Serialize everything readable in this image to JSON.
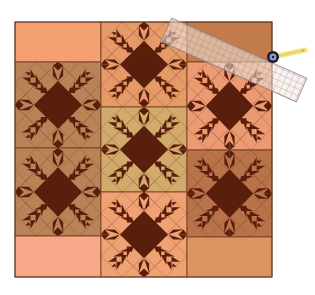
{
  "image": {
    "subject": "quilt layout with feathered star blocks and ruler with rotary cutter",
    "width": 315,
    "height": 295
  },
  "colors": {
    "background": "#ffffff",
    "dark_brown": "#5a1e0c",
    "seam_line": "#6b3b20",
    "left_top_rect": "#f4a070",
    "left_bottom_rect": "#f7a888",
    "left_block_bg": "#b98358",
    "middle_top_block_bg": "#e59a68",
    "middle_mid_block_bg": "#d2aa6c",
    "middle_bottom_block_bg": "#f0a274",
    "right_top_rect": "#c27b4a",
    "right_upper_block_bg": "#eb9a72",
    "right_lower_block_bg": "#b8734a",
    "right_bottom_rect": "#dd9460",
    "ruler_fill": "#f6e8e0",
    "ruler_grid": "#8a7a80",
    "cutter_handle": "#f3e27a",
    "cutter_blade": "#1a1a2a"
  },
  "quilt": {
    "left": 15,
    "top": 22,
    "right": 272,
    "bottom": 277,
    "columns": [
      {
        "name": "left",
        "x": 15,
        "w": 86,
        "pieces": [
          {
            "type": "rect",
            "y": 22,
            "h": 40,
            "color_key": "left_top_rect"
          },
          {
            "type": "block",
            "y": 62,
            "h": 86,
            "color_key": "left_block_bg"
          },
          {
            "type": "block",
            "y": 148,
            "h": 88,
            "color_key": "left_block_bg"
          },
          {
            "type": "rect",
            "y": 236,
            "h": 41,
            "color_key": "left_bottom_rect"
          }
        ]
      },
      {
        "name": "middle",
        "x": 101,
        "w": 86,
        "pieces": [
          {
            "type": "block",
            "y": 22,
            "h": 85,
            "color_key": "middle_top_block_bg"
          },
          {
            "type": "block",
            "y": 107,
            "h": 85,
            "color_key": "middle_mid_block_bg"
          },
          {
            "type": "block",
            "y": 192,
            "h": 85,
            "color_key": "middle_bottom_block_bg"
          }
        ]
      },
      {
        "name": "right",
        "x": 187,
        "w": 85,
        "pieces": [
          {
            "type": "rect",
            "y": 22,
            "h": 40,
            "color_key": "right_top_rect"
          },
          {
            "type": "block",
            "y": 62,
            "h": 88,
            "color_key": "right_upper_block_bg"
          },
          {
            "type": "block",
            "y": 150,
            "h": 87,
            "color_key": "right_lower_block_bg"
          },
          {
            "type": "rect",
            "y": 237,
            "h": 40,
            "color_key": "right_bottom_rect"
          }
        ]
      }
    ]
  },
  "ruler": {
    "cx": 234,
    "cy": 60,
    "length": 148,
    "width": 26,
    "angle_deg": 24,
    "grid_cols": 24,
    "grid_rows": 4
  },
  "cutter": {
    "blade_cx": 273,
    "blade_cy": 57,
    "blade_r": 6,
    "handle_x2": 305,
    "handle_y2": 50
  }
}
